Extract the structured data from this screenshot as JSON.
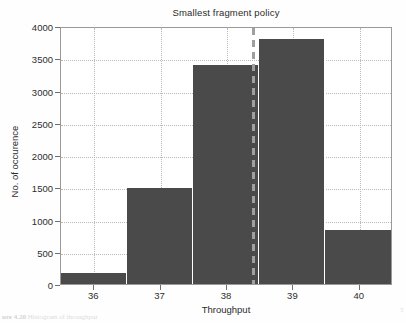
{
  "chart_data": {
    "type": "bar",
    "title": "Smallest fragment policy",
    "xlabel": "Throughput",
    "ylabel": "No. of occurence",
    "categories": [
      "36",
      "37",
      "38",
      "39",
      "40"
    ],
    "values": [
      170,
      1500,
      3420,
      3830,
      840
    ],
    "xlim": [
      35.5,
      40.5
    ],
    "ylim": [
      0,
      4000
    ],
    "yticks": [
      0,
      500,
      1000,
      1500,
      2000,
      2500,
      3000,
      3500,
      4000
    ],
    "ytick_labels": [
      "0",
      "500",
      "1000",
      "1500",
      "2000",
      "2500",
      "3000",
      "3500",
      "4000"
    ],
    "xtick_labels": [
      "36",
      "37",
      "38",
      "39",
      "40"
    ],
    "grid": true,
    "legend": "none",
    "bar_color": "#4a4a4a",
    "grid_color": "#b9b9b9",
    "axis_color": "#9a9a9a",
    "annotations": [
      {
        "name": "threshold-line",
        "type": "vertical-dashed-line",
        "x_value": 38.4,
        "color": "#9f9f9f",
        "style": "dashed"
      }
    ]
  },
  "caption": {
    "remnant": "ure 4.20",
    "remnant_tail": "Histogram of throughput",
    "page_corner": "T"
  }
}
